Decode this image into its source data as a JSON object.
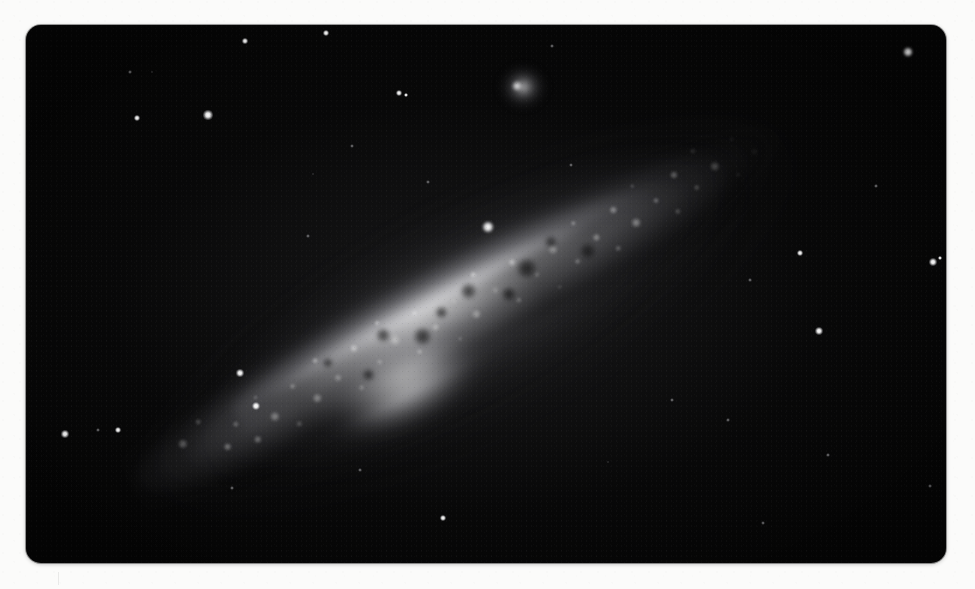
{
  "page": {
    "width": 975,
    "height": 589,
    "background_color": "#fbfbfa",
    "caption": ""
  },
  "plate": {
    "label": "astronomical-photographic-plate",
    "x": 26,
    "y": 25,
    "width": 920,
    "height": 538,
    "corner_radius": 15,
    "sky_color": "#050505",
    "subject": "edge-on spiral galaxy with small companion",
    "orientation_degrees": -28.5
  },
  "galaxy": {
    "name": "edge-on-spiral-galaxy",
    "center_x": 486,
    "center_y": 294,
    "major_axis_px": 800,
    "minor_axis_px": 132,
    "position_angle_deg": -28.5,
    "core_color": "#f6f6f7",
    "halo_color": "#96969a"
  },
  "companion": {
    "name": "companion-elliptical-galaxy",
    "x": 492,
    "y": 58,
    "width": 62,
    "height": 58,
    "core_x": 517,
    "core_y": 86,
    "core_size": 10
  },
  "dust_lane": {
    "name": "dust-lane",
    "present": true,
    "opacity": 0.85
  },
  "knots": [
    {
      "x": 72,
      "y": 72,
      "r": 5.0,
      "i": 0.95
    },
    {
      "x": 96,
      "y": 60,
      "r": 3.4,
      "i": 0.8
    },
    {
      "x": 110,
      "y": 96,
      "r": 4.2,
      "i": 0.88
    },
    {
      "x": 128,
      "y": 80,
      "r": 2.6,
      "i": 0.7
    },
    {
      "x": 140,
      "y": 104,
      "r": 3.8,
      "i": 0.85
    },
    {
      "x": 158,
      "y": 66,
      "r": 2.4,
      "i": 0.66
    },
    {
      "x": 166,
      "y": 92,
      "r": 4.6,
      "i": 0.92
    },
    {
      "x": 184,
      "y": 110,
      "r": 2.8,
      "i": 0.72
    },
    {
      "x": 196,
      "y": 74,
      "r": 3.2,
      "i": 0.78
    },
    {
      "x": 212,
      "y": 96,
      "r": 5.2,
      "i": 0.96
    },
    {
      "x": 228,
      "y": 62,
      "r": 2.6,
      "i": 0.68
    },
    {
      "x": 240,
      "y": 88,
      "r": 3.6,
      "i": 0.82
    },
    {
      "x": 256,
      "y": 108,
      "r": 2.9,
      "i": 0.74
    },
    {
      "x": 268,
      "y": 70,
      "r": 4.0,
      "i": 0.86
    },
    {
      "x": 284,
      "y": 94,
      "r": 3.0,
      "i": 0.76
    },
    {
      "x": 300,
      "y": 58,
      "r": 2.5,
      "i": 0.67
    },
    {
      "x": 308,
      "y": 82,
      "r": 5.6,
      "i": 0.98
    },
    {
      "x": 324,
      "y": 104,
      "r": 3.3,
      "i": 0.79
    },
    {
      "x": 338,
      "y": 68,
      "r": 2.7,
      "i": 0.71
    },
    {
      "x": 350,
      "y": 90,
      "r": 4.4,
      "i": 0.9
    },
    {
      "x": 366,
      "y": 112,
      "r": 2.4,
      "i": 0.64
    },
    {
      "x": 378,
      "y": 76,
      "r": 3.5,
      "i": 0.81
    },
    {
      "x": 392,
      "y": 98,
      "r": 4.8,
      "i": 0.93
    },
    {
      "x": 408,
      "y": 62,
      "r": 2.6,
      "i": 0.69
    },
    {
      "x": 420,
      "y": 86,
      "r": 3.8,
      "i": 0.84
    },
    {
      "x": 436,
      "y": 106,
      "r": 2.8,
      "i": 0.73
    },
    {
      "x": 448,
      "y": 70,
      "r": 4.2,
      "i": 0.88
    },
    {
      "x": 464,
      "y": 92,
      "r": 3.1,
      "i": 0.77
    },
    {
      "x": 478,
      "y": 114,
      "r": 2.3,
      "i": 0.62
    },
    {
      "x": 490,
      "y": 78,
      "r": 5.0,
      "i": 0.94
    },
    {
      "x": 506,
      "y": 100,
      "r": 3.4,
      "i": 0.8
    },
    {
      "x": 520,
      "y": 64,
      "r": 2.5,
      "i": 0.66
    },
    {
      "x": 534,
      "y": 88,
      "r": 4.0,
      "i": 0.86
    },
    {
      "x": 548,
      "y": 108,
      "r": 2.7,
      "i": 0.7
    },
    {
      "x": 562,
      "y": 72,
      "r": 3.6,
      "i": 0.83
    },
    {
      "x": 576,
      "y": 94,
      "r": 4.6,
      "i": 0.91
    },
    {
      "x": 590,
      "y": 60,
      "r": 2.4,
      "i": 0.65
    },
    {
      "x": 604,
      "y": 84,
      "r": 3.2,
      "i": 0.78
    },
    {
      "x": 618,
      "y": 104,
      "r": 2.6,
      "i": 0.68
    },
    {
      "x": 632,
      "y": 70,
      "r": 4.4,
      "i": 0.89
    },
    {
      "x": 646,
      "y": 92,
      "r": 3.0,
      "i": 0.75
    },
    {
      "x": 660,
      "y": 58,
      "r": 2.8,
      "i": 0.72
    },
    {
      "x": 672,
      "y": 82,
      "r": 5.2,
      "i": 0.95
    },
    {
      "x": 688,
      "y": 100,
      "r": 2.5,
      "i": 0.66
    },
    {
      "x": 700,
      "y": 66,
      "r": 3.4,
      "i": 0.8
    },
    {
      "x": 714,
      "y": 88,
      "r": 4.0,
      "i": 0.85
    },
    {
      "x": 728,
      "y": 72,
      "r": 2.6,
      "i": 0.69
    },
    {
      "x": 742,
      "y": 94,
      "r": 3.2,
      "i": 0.77
    },
    {
      "x": 756,
      "y": 62,
      "r": 2.4,
      "i": 0.64
    },
    {
      "x": 768,
      "y": 84,
      "r": 3.8,
      "i": 0.82
    }
  ],
  "dust_blobs": [
    {
      "x": 300,
      "y": 72,
      "r": 7
    },
    {
      "x": 334,
      "y": 92,
      "r": 9
    },
    {
      "x": 362,
      "y": 80,
      "r": 6
    },
    {
      "x": 396,
      "y": 74,
      "r": 8
    },
    {
      "x": 430,
      "y": 96,
      "r": 7
    },
    {
      "x": 458,
      "y": 82,
      "r": 10
    },
    {
      "x": 492,
      "y": 70,
      "r": 6
    },
    {
      "x": 520,
      "y": 96,
      "r": 8
    },
    {
      "x": 268,
      "y": 100,
      "r": 6
    },
    {
      "x": 238,
      "y": 70,
      "r": 5
    }
  ],
  "stars": [
    {
      "x": 908,
      "y": 52,
      "r": 5.2,
      "class": "lg"
    },
    {
      "x": 488,
      "y": 227,
      "r": 6.0,
      "class": "lg"
    },
    {
      "x": 208,
      "y": 115,
      "r": 4.6,
      "class": "md"
    },
    {
      "x": 137,
      "y": 118,
      "r": 3.2,
      "class": "md"
    },
    {
      "x": 326,
      "y": 33,
      "r": 3.4,
      "class": "md"
    },
    {
      "x": 245,
      "y": 41,
      "r": 2.6,
      "class": "sm"
    },
    {
      "x": 399,
      "y": 93,
      "r": 3.0,
      "class": "sm"
    },
    {
      "x": 406,
      "y": 95,
      "r": 2.0,
      "class": "sm"
    },
    {
      "x": 800,
      "y": 253,
      "r": 3.4,
      "class": "md"
    },
    {
      "x": 933,
      "y": 262,
      "r": 3.8,
      "class": "md"
    },
    {
      "x": 940,
      "y": 258,
      "r": 2.2,
      "class": "sm"
    },
    {
      "x": 819,
      "y": 331,
      "r": 4.0,
      "class": "md"
    },
    {
      "x": 65,
      "y": 434,
      "r": 3.6,
      "class": "md"
    },
    {
      "x": 98,
      "y": 430,
      "r": 2.0,
      "class": "faint"
    },
    {
      "x": 118,
      "y": 430,
      "r": 3.4,
      "class": "md"
    },
    {
      "x": 240,
      "y": 373,
      "r": 3.6,
      "class": "md"
    },
    {
      "x": 256,
      "y": 406,
      "r": 4.2,
      "class": "md"
    },
    {
      "x": 443,
      "y": 518,
      "r": 3.4,
      "class": "md"
    },
    {
      "x": 352,
      "y": 146,
      "r": 2.0,
      "class": "faint"
    },
    {
      "x": 428,
      "y": 182,
      "r": 1.8,
      "class": "faint"
    },
    {
      "x": 552,
      "y": 46,
      "r": 1.8,
      "class": "faint"
    },
    {
      "x": 571,
      "y": 165,
      "r": 2.0,
      "class": "faint"
    },
    {
      "x": 672,
      "y": 400,
      "r": 2.0,
      "class": "faint"
    },
    {
      "x": 728,
      "y": 420,
      "r": 1.6,
      "class": "faint"
    },
    {
      "x": 750,
      "y": 280,
      "r": 1.6,
      "class": "faint"
    },
    {
      "x": 763,
      "y": 523,
      "r": 2.2,
      "class": "faint"
    },
    {
      "x": 828,
      "y": 455,
      "r": 1.8,
      "class": "faint"
    },
    {
      "x": 930,
      "y": 486,
      "r": 2.2,
      "class": "faint"
    },
    {
      "x": 130,
      "y": 72,
      "r": 1.6,
      "class": "faint"
    },
    {
      "x": 152,
      "y": 72,
      "r": 1.4,
      "class": "faint"
    },
    {
      "x": 308,
      "y": 236,
      "r": 1.6,
      "class": "faint"
    },
    {
      "x": 313,
      "y": 174,
      "r": 1.4,
      "class": "faint"
    },
    {
      "x": 360,
      "y": 470,
      "r": 1.8,
      "class": "faint"
    },
    {
      "x": 232,
      "y": 488,
      "r": 1.6,
      "class": "faint"
    },
    {
      "x": 876,
      "y": 186,
      "r": 1.8,
      "class": "faint"
    },
    {
      "x": 608,
      "y": 462,
      "r": 1.4,
      "class": "faint"
    }
  ]
}
